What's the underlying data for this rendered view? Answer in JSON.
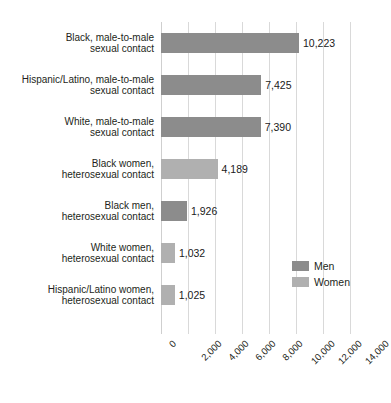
{
  "chart_data": {
    "type": "bar",
    "orientation": "horizontal",
    "title": "",
    "xlabel": "",
    "ylabel": "",
    "xlim": [
      0,
      14000
    ],
    "xticks": [
      "0",
      "2,000",
      "4,000",
      "6,000",
      "8,000",
      "10,000",
      "12,000",
      "14,000"
    ],
    "xtick_values": [
      0,
      2000,
      4000,
      6000,
      8000,
      10000,
      12000,
      14000
    ],
    "grid": true,
    "legend_position": "middle-right",
    "categories": [
      "Black, male-to-male\nsexual contact",
      "Hispanic/Latino, male-to-male\nsexual contact",
      "White, male-to-male\nsexual contact",
      "Black women,\nheterosexual contact",
      "Black men,\nheterosexual contact",
      "White women,\nheterosexual contact",
      "Hispanic/Latino women,\nheterosexual contact"
    ],
    "values": [
      10223,
      7425,
      7390,
      4189,
      1926,
      1032,
      1025
    ],
    "value_labels": [
      "10,223",
      "7,425",
      "7,390",
      "4,189",
      "1,926",
      "1,032",
      "1,025"
    ],
    "series_of_bar": [
      "Men",
      "Men",
      "Men",
      "Women",
      "Men",
      "Women",
      "Women"
    ],
    "series": [
      {
        "name": "Men",
        "color": "#8c8c8c"
      },
      {
        "name": "Women",
        "color": "#b0b0b0"
      }
    ],
    "legend": [
      {
        "label": "Men",
        "color": "#8c8c8c"
      },
      {
        "label": "Women",
        "color": "#b0b0b0"
      }
    ]
  }
}
